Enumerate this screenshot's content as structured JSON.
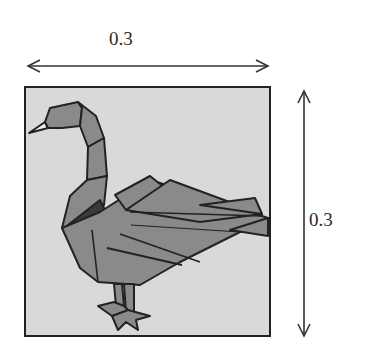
{
  "figure": {
    "width_label": "0.3",
    "height_label": "0.3",
    "colors": {
      "background": "#d9d9d9",
      "swan_fill": "#8a8a8a",
      "swan_dark": "#3a3a3a",
      "outline": "#222222",
      "beak": "#eeeeee"
    }
  }
}
